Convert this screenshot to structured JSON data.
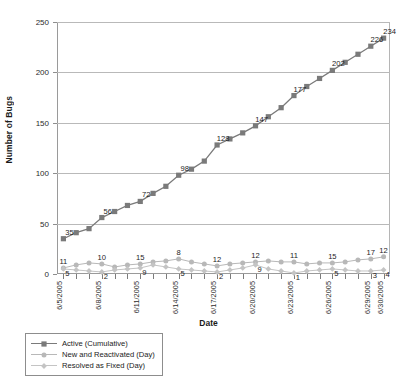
{
  "chart_data": {
    "type": "line",
    "title": "",
    "xlabel": "Date",
    "ylabel": "Number of Bugs",
    "ylim": [
      0,
      250
    ],
    "yticks": [
      0,
      50,
      100,
      150,
      200,
      250
    ],
    "grid": true,
    "legend_position": "bottom-left",
    "x": [
      "6/5/2005",
      "6/6/2005",
      "6/7/2005",
      "6/8/2005",
      "6/9/2005",
      "6/10/2005",
      "6/11/2005",
      "6/12/2005",
      "6/13/2005",
      "6/14/2005",
      "6/15/2005",
      "6/16/2005",
      "6/17/2005",
      "6/18/2005",
      "6/19/2005",
      "6/20/2005",
      "6/21/2005",
      "6/22/2005",
      "6/23/2005",
      "6/24/2005",
      "6/25/2005",
      "6/26/2005",
      "6/27/2005",
      "6/28/2005",
      "6/29/2005",
      "6/30/2005"
    ],
    "xtick_labels": [
      "6/5/2005",
      "6/8/2005",
      "6/11/2005",
      "6/14/2005",
      "6/17/2005",
      "6/20/2005",
      "6/23/2005",
      "6/26/2005",
      "6/29/2005",
      "6/30/2005"
    ],
    "xtick_indices": [
      0,
      3,
      6,
      9,
      12,
      15,
      18,
      21,
      24,
      25
    ],
    "label_indices": [
      0,
      3,
      6,
      9,
      12,
      15,
      18,
      21,
      24,
      25
    ],
    "series": [
      {
        "name": "Active (Cumulative)",
        "color": "#7a7a7a",
        "marker": "square",
        "values": [
          35,
          41,
          45,
          56,
          62,
          68,
          72,
          80,
          87,
          98,
          104,
          112,
          128,
          134,
          140,
          147,
          156,
          165,
          177,
          186,
          194,
          202,
          210,
          218,
          226,
          234
        ],
        "labels": [
          35,
          56,
          72,
          98,
          128,
          147,
          177,
          202,
          226,
          234
        ]
      },
      {
        "name": "New and Reactivated (Day)",
        "color": "#b8b8b8",
        "marker": "circle",
        "values": [
          6,
          9,
          11,
          10,
          7,
          9,
          10,
          12,
          13,
          15,
          12,
          10,
          8,
          10,
          11,
          12,
          13,
          12,
          12,
          10,
          11,
          11,
          12,
          14,
          15,
          17
        ],
        "labels": [
          11,
          10,
          15,
          8,
          12,
          12,
          11,
          15,
          17,
          12
        ]
      },
      {
        "name": "Resolved as Fixed (Day)",
        "color": "#c4c4c4",
        "marker": "diamond",
        "values": [
          5,
          4,
          3,
          2,
          4,
          5,
          6,
          9,
          7,
          5,
          4,
          3,
          2,
          4,
          6,
          9,
          5,
          3,
          1,
          3,
          4,
          5,
          4,
          3,
          3,
          4
        ],
        "labels": [
          5,
          2,
          9,
          5,
          2,
          9,
          1,
          5,
          3,
          4
        ]
      }
    ]
  }
}
